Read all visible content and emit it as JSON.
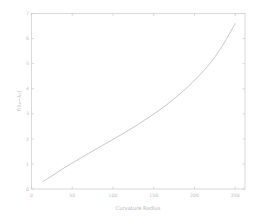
{
  "chart_data": {
    "type": "line",
    "title": "",
    "xlabel": "Curvature Radius",
    "ylabel": "f(λ₀−λ₁)",
    "xlim": [
      0,
      262
    ],
    "ylim": [
      0,
      7
    ],
    "xticks": [
      0,
      50,
      100,
      150,
      200,
      250
    ],
    "xticklabels": [
      "0",
      "50",
      "100",
      "150",
      "200",
      "250"
    ],
    "yticks": [
      0,
      1,
      2,
      3,
      4,
      5,
      6,
      7
    ],
    "yticklabels": [
      "0",
      "1",
      "2",
      "3",
      "4",
      "5",
      "6",
      "7"
    ],
    "grid": false,
    "legend": false,
    "series": [
      {
        "name": "f(λ₀−λ₁)",
        "color": "#b8b8b8",
        "x": [
          14,
          25,
          40,
          55,
          70,
          85,
          100,
          115,
          130,
          145,
          160,
          175,
          190,
          205,
          220,
          235,
          250
        ],
        "y": [
          0.3,
          0.52,
          0.84,
          1.13,
          1.42,
          1.7,
          1.98,
          2.26,
          2.56,
          2.88,
          3.22,
          3.6,
          4.02,
          4.5,
          5.05,
          5.75,
          6.6
        ]
      }
    ],
    "frame_color": "#c9c9c9",
    "text_color": "#bdbdbd",
    "background": "#ffffff"
  }
}
